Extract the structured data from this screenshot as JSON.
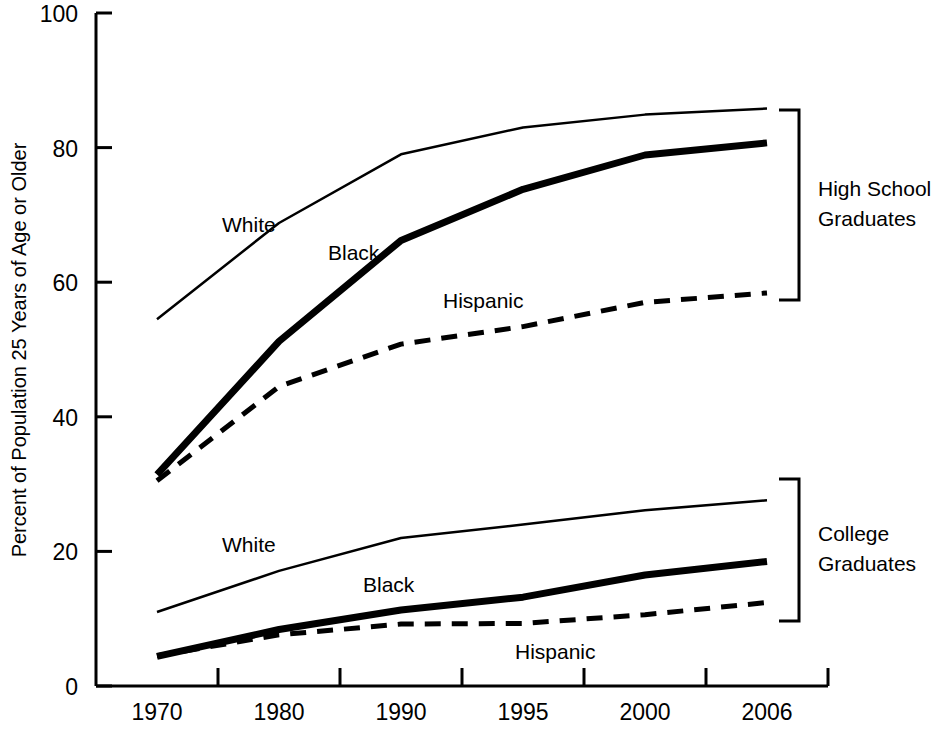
{
  "chart_data": {
    "type": "line",
    "title": "",
    "xlabel": "",
    "ylabel": "Percent of Population 25 Years of Age or Older",
    "categories": [
      "1970",
      "1980",
      "1990",
      "1995",
      "2000",
      "2006"
    ],
    "ylim": [
      0,
      100
    ],
    "yticks": [
      "0",
      "20",
      "40",
      "60",
      "80",
      "100"
    ],
    "ytick_values": [
      0,
      20,
      40,
      60,
      80,
      100
    ],
    "grid": false,
    "legend": "inline-annotations",
    "groups": [
      {
        "name": "High School Graduates",
        "bracket_label_line1": "High School",
        "bracket_label_line2": "Graduates",
        "series": [
          {
            "name": "White",
            "style": "thin-solid",
            "values": [
              54.5,
              68.8,
              79.0,
              83.0,
              84.9,
              85.8
            ]
          },
          {
            "name": "Black",
            "style": "thick-solid",
            "values": [
              31.4,
              51.2,
              66.2,
              73.8,
              78.9,
              80.7
            ]
          },
          {
            "name": "Hispanic",
            "style": "dashed",
            "values": [
              30.5,
              44.5,
              50.8,
              53.4,
              57.0,
              58.4
            ]
          }
        ]
      },
      {
        "name": "College Graduates",
        "bracket_label_line1": "College",
        "bracket_label_line2": "Graduates",
        "series": [
          {
            "name": "White",
            "style": "thin-solid",
            "values": [
              11.0,
              17.1,
              22.0,
              24.0,
              26.1,
              27.6
            ]
          },
          {
            "name": "Black",
            "style": "thick-solid",
            "values": [
              4.4,
              8.4,
              11.3,
              13.2,
              16.5,
              18.5
            ]
          },
          {
            "name": "Hispanic",
            "style": "dashed",
            "values": [
              4.5,
              7.6,
              9.2,
              9.3,
              10.6,
              12.4
            ]
          }
        ]
      }
    ],
    "annotations": [
      {
        "text": "White",
        "series": "White",
        "group": "High School Graduates",
        "x": 222,
        "y": 232
      },
      {
        "text": "Black",
        "series": "Black",
        "group": "High School Graduates",
        "x": 328,
        "y": 260
      },
      {
        "text": "Hispanic",
        "series": "Hispanic",
        "group": "High School Graduates",
        "x": 443,
        "y": 308
      },
      {
        "text": "White",
        "series": "White",
        "group": "College Graduates",
        "x": 222,
        "y": 552
      },
      {
        "text": "Black",
        "series": "Black",
        "group": "College Graduates",
        "x": 363,
        "y": 592
      },
      {
        "text": "Hispanic",
        "series": "Hispanic",
        "group": "College Graduates",
        "x": 515,
        "y": 659
      }
    ],
    "colors": {
      "line": "#000000",
      "axis": "#000000",
      "background": "#ffffff"
    }
  }
}
